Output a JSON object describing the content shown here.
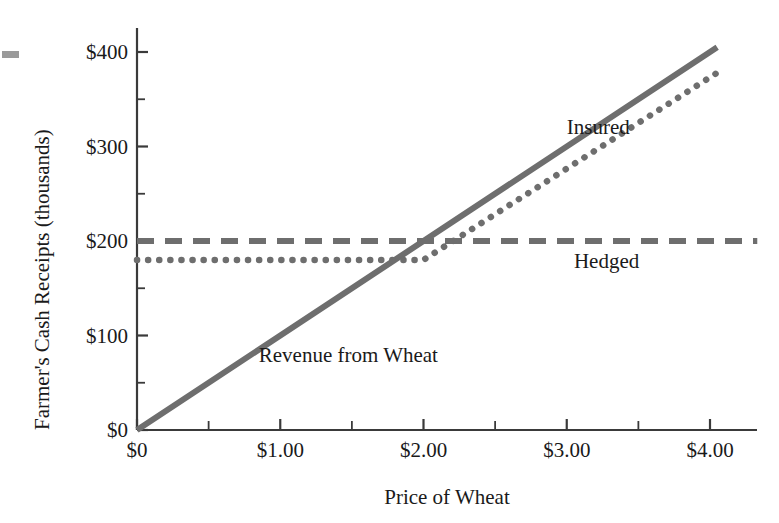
{
  "chart_data": {
    "type": "line",
    "title": "",
    "xlabel": "Price of Wheat",
    "ylabel": "Farmer's Cash Receipts (thousands)",
    "xlim": [
      0,
      4.3
    ],
    "ylim": [
      0,
      430
    ],
    "grid": false,
    "legend_position": "inline-annotations",
    "x_ticks": [
      {
        "value": 0,
        "label": "$0"
      },
      {
        "value": 0.5,
        "label": ""
      },
      {
        "value": 1.0,
        "label": "$1.00"
      },
      {
        "value": 1.5,
        "label": ""
      },
      {
        "value": 2.0,
        "label": "$2.00"
      },
      {
        "value": 2.5,
        "label": ""
      },
      {
        "value": 3.0,
        "label": "$3.00"
      },
      {
        "value": 3.5,
        "label": ""
      },
      {
        "value": 4.0,
        "label": "$4.00"
      }
    ],
    "y_ticks": [
      {
        "value": 0,
        "label": "$0"
      },
      {
        "value": 50,
        "label": ""
      },
      {
        "value": 100,
        "label": "$100"
      },
      {
        "value": 150,
        "label": ""
      },
      {
        "value": 200,
        "label": "$200"
      },
      {
        "value": 250,
        "label": ""
      },
      {
        "value": 300,
        "label": "$300"
      },
      {
        "value": 350,
        "label": ""
      },
      {
        "value": 400,
        "label": "$400"
      }
    ],
    "series": [
      {
        "name": "Revenue from Wheat",
        "style": "solid",
        "color": "#6e6e6e",
        "points": [
          [
            0,
            0
          ],
          [
            4.0,
            400
          ],
          [
            4.05,
            405
          ]
        ]
      },
      {
        "name": "Hedged",
        "style": "dashed",
        "color": "#6e6e6e",
        "points": [
          [
            0,
            200
          ],
          [
            4.33,
            200
          ]
        ]
      },
      {
        "name": "Insured",
        "style": "dotted",
        "color": "#6e6e6e",
        "points": [
          [
            0,
            180
          ],
          [
            2.0,
            180
          ],
          [
            4.05,
            378
          ]
        ]
      }
    ],
    "annotations": [
      {
        "text": "Insured",
        "x": 3.0,
        "y": 320
      },
      {
        "text": "Hedged",
        "x": 3.05,
        "y": 178
      },
      {
        "text": "Revenue from Wheat",
        "x": 0.85,
        "y": 78
      }
    ]
  },
  "axis": {
    "x_title": "Price of Wheat",
    "y_title": "Farmer's Cash Receipts (thousands)"
  },
  "colors": {
    "line": "#6e6e6e",
    "axis": "#3a3a3a",
    "text": "#1a1a1a",
    "background": "#ffffff",
    "edge_mark": "#9a9a9a"
  }
}
